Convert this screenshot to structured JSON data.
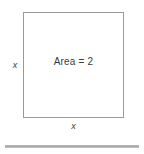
{
  "figure": {
    "name": "square-area-diagram",
    "shape": {
      "type": "square",
      "inner_label": "Area = 2",
      "side_label_left": "x",
      "side_label_bottom": "x",
      "border_color": "#9a9a9a",
      "fill_color": "#ffffff"
    },
    "rule": {
      "name": "horizontal-rule",
      "color": "#a6a6a6"
    },
    "text_color": "#3b3b3b",
    "background_color": "#ffffff"
  }
}
